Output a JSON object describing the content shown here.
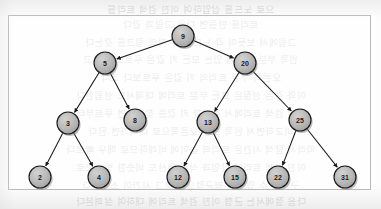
{
  "figure": {
    "type": "binary-search-tree-diagram",
    "caption": "",
    "frame": {
      "x": 8,
      "y": 15,
      "width": 363,
      "height": 175,
      "border_color": "#b9b9b9"
    }
  },
  "style": {
    "node_fill": "#b4b4b4",
    "node_fill_light": "#cfcfcf",
    "node_stroke": "#1c1c1c",
    "edge_color": "#1a1a1a",
    "shadow_color": "#8a8a8a",
    "label_color": "#1a1a1a",
    "page_background": "#fdfdfd",
    "bleed_text_color": "#c9c9c9"
  },
  "tree": {
    "root": "9",
    "node_radius": 11,
    "nodes": [
      {
        "id": "n9",
        "label": "9",
        "cx": 183,
        "cy": 36,
        "depth": 0
      },
      {
        "id": "n5",
        "label": "5",
        "cx": 105,
        "cy": 63,
        "depth": 1
      },
      {
        "id": "n20",
        "label": "20",
        "cx": 245,
        "cy": 63,
        "depth": 1
      },
      {
        "id": "n3",
        "label": "3",
        "cx": 68,
        "cy": 123,
        "depth": 2
      },
      {
        "id": "n8",
        "label": "8",
        "cx": 135,
        "cy": 120,
        "depth": 2
      },
      {
        "id": "n13",
        "label": "13",
        "cx": 208,
        "cy": 122,
        "depth": 2
      },
      {
        "id": "n25",
        "label": "25",
        "cx": 300,
        "cy": 120,
        "depth": 2
      },
      {
        "id": "n2",
        "label": "2",
        "cx": 40,
        "cy": 177,
        "depth": 3
      },
      {
        "id": "n4",
        "label": "4",
        "cx": 99,
        "cy": 177,
        "depth": 3
      },
      {
        "id": "n12",
        "label": "12",
        "cx": 178,
        "cy": 177,
        "depth": 3
      },
      {
        "id": "n15",
        "label": "15",
        "cx": 235,
        "cy": 177,
        "depth": 3
      },
      {
        "id": "n22",
        "label": "22",
        "cx": 278,
        "cy": 177,
        "depth": 3
      },
      {
        "id": "n31",
        "label": "31",
        "cx": 345,
        "cy": 177,
        "depth": 3
      }
    ],
    "edges": [
      {
        "from": "n9",
        "to": "n5",
        "side": "left"
      },
      {
        "from": "n9",
        "to": "n20",
        "side": "right"
      },
      {
        "from": "n5",
        "to": "n3",
        "side": "left"
      },
      {
        "from": "n5",
        "to": "n8",
        "side": "right"
      },
      {
        "from": "n20",
        "to": "n13",
        "side": "left"
      },
      {
        "from": "n20",
        "to": "n25",
        "side": "right"
      },
      {
        "from": "n3",
        "to": "n2",
        "side": "left"
      },
      {
        "from": "n3",
        "to": "n4",
        "side": "right"
      },
      {
        "from": "n13",
        "to": "n12",
        "side": "left"
      },
      {
        "from": "n13",
        "to": "n15",
        "side": "right"
      },
      {
        "from": "n25",
        "to": "n22",
        "side": "left"
      },
      {
        "from": "n25",
        "to": "n31",
        "side": "right"
      }
    ]
  },
  "background_bleed": {
    "description": "faint mirrored Korean text showing through from the reverse side of the scanned page",
    "lines": [
      {
        "y": 2,
        "text": "으로 노드를 삽입하여 이진 검색 트리를"
      },
      {
        "y": 17,
        "text": "트리를 만들면 다음 그림과 같다"
      },
      {
        "y": 35,
        "text": "그림에서 보듯이 각 노드는 두 개의 링크를 갖는다"
      },
      {
        "y": 52,
        "text": "왼쪽 부분 트리에 있는 모든 키 값은 루트보다 작고"
      },
      {
        "y": 70,
        "text": "오른쪽 부분 트리의 키 값은 루트보다 크다"
      },
      {
        "y": 88,
        "text": "이와 같은 성질은 모든 부분 트리에 대해서도 성립한다"
      },
      {
        "y": 106,
        "text": "이진 검색 트리에서 특정한 키 값을 찾으려면 루트부터"
      },
      {
        "y": 124,
        "text": "비교하면서 왼쪽 또는 오른쪽으로 내려가면 된다"
      },
      {
        "y": 142,
        "text": "따라서 탐색 시간은 트리의 높이에 비례하므로 매우 빠르다"
      },
      {
        "y": 160,
        "text": "이진 검색 트리의 삽입과 삭제 연산도 비슷한 방법으로"
      },
      {
        "y": 178,
        "text": "구현할 수 있으며 평균적으로 로그 시간이 소요된다"
      },
      {
        "y": 194,
        "text": "다음 절에서는 균형 이진 검색 트리에 대하여 살펴본다"
      }
    ]
  }
}
